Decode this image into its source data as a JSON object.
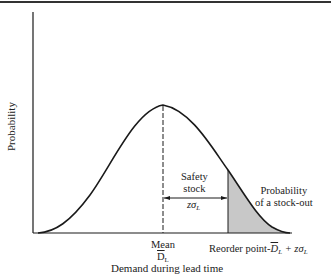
{
  "diagram": {
    "y_axis_label": "Probability",
    "x_axis_label": "Demand during lead time",
    "annotations": {
      "safety_stock_line1": "Safety",
      "safety_stock_line2": "stock",
      "z_sigma_base": "zσ",
      "z_sigma_sub": "L",
      "stockout_line1": "Probability",
      "stockout_line2": "of a stock-out",
      "mean_label": "Mean",
      "mean_symbol": "D",
      "mean_symbol_sub": "L",
      "reorder_prefix": "Reorder point-",
      "reorder_symbol": "D",
      "reorder_symbol_sub": "L",
      "reorder_suffix": " + zσ",
      "reorder_suffix_sub": "L"
    },
    "colors": {
      "line": "#1a1a1a",
      "shade": "#c8c8c8",
      "background": "#ffffff"
    }
  }
}
